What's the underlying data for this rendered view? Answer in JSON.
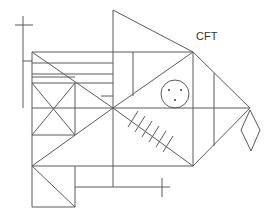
{
  "diagram": {
    "title_label": "CFT",
    "stroke_color": "#5a5a5a",
    "background": "#ffffff",
    "elements": {
      "crosses": [
        "left-vertical-cross",
        "bottom-small-cross"
      ],
      "circle": {
        "cx": 175,
        "cy": 94,
        "r": 14,
        "dots": 3
      },
      "diamond": {
        "top": [
          250,
          110
        ],
        "right": [
          260,
          130
        ],
        "bottom": [
          251,
          151
        ],
        "left": [
          241,
          130
        ]
      },
      "hatch_ticks": 6
    }
  }
}
